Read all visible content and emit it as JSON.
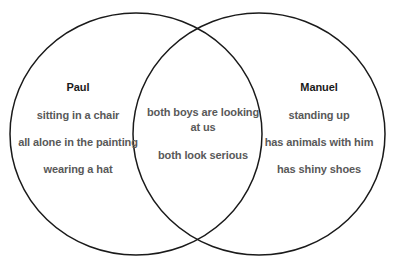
{
  "diagram": {
    "type": "venn-two-set",
    "background_color": "#ffffff",
    "stroke_color": "#1a1a1a",
    "title_color": "#1a1a1a",
    "item_color": "#595959",
    "left_set": {
      "title": "Paul",
      "items": [
        "sitting in a chair",
        "all alone in the painting",
        "wearing a hat"
      ]
    },
    "intersection": {
      "title": "",
      "items": [
        "both boys are looking at us",
        "both look serious"
      ]
    },
    "right_set": {
      "title": "Manuel",
      "items": [
        "standing up",
        "has animals with him",
        "has shiny shoes"
      ]
    }
  }
}
